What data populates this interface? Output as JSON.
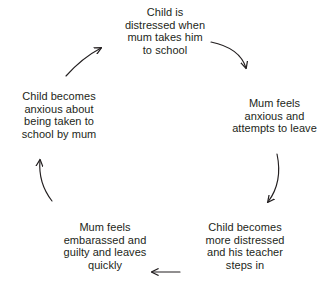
{
  "diagram": {
    "type": "cycle",
    "title": "",
    "direction": "clockwise",
    "text_color": "#231f20",
    "arrow_color": "#231f20",
    "background_color": "#ffffff",
    "nodes": [
      {
        "id": "top",
        "position": "top",
        "text": "Child is\ndistressed when\nmum takes him\nto school"
      },
      {
        "id": "right",
        "position": "right",
        "text": "Mum feels\nanxious and\nattempts to leave"
      },
      {
        "id": "bottom-right",
        "position": "bottom-right",
        "text": "Child becomes\nmore distressed\nand his teacher\nsteps in"
      },
      {
        "id": "bottom-left",
        "position": "bottom-left",
        "text": "Mum feels\nembarassed and\nguilty and leaves\nquickly"
      },
      {
        "id": "left",
        "position": "left",
        "text": "Child becomes\nanxious about\nbeing taken to\nschool by mum"
      }
    ],
    "arrows": [
      {
        "id": "top-to-right",
        "from": "top",
        "to": "right",
        "style": "curved"
      },
      {
        "id": "right-to-bottom-right",
        "from": "right",
        "to": "bottom-right",
        "style": "curved"
      },
      {
        "id": "bottom-right-to-bottom-left",
        "from": "bottom-right",
        "to": "bottom-left",
        "style": "straight"
      },
      {
        "id": "bottom-left-to-left",
        "from": "bottom-left",
        "to": "left",
        "style": "curved"
      },
      {
        "id": "left-to-top",
        "from": "left",
        "to": "top",
        "style": "curved"
      }
    ]
  }
}
